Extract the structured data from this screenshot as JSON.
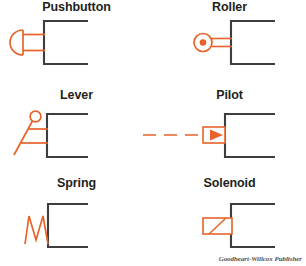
{
  "figure": {
    "credit": "Goodheart-Willcox Publisher",
    "colors": {
      "symbol_orange": "#E8632A",
      "box_dark": "#3E3E42",
      "label_text": "#231F20",
      "credit_text": "#55504E",
      "background": "#FFFFFF"
    }
  },
  "cells": [
    {
      "id": "pushbutton",
      "label": "Pushbutton",
      "icon": "pushbutton-actuator-icon",
      "description": "Semicircular button head with two-line stem attached to open-right valve box",
      "row": 1,
      "column": 1
    },
    {
      "id": "roller",
      "label": "Roller",
      "icon": "roller-actuator-icon",
      "description": "Circle with solid center dot and two-line stem attached to open-right valve box",
      "row": 1,
      "column": 2
    },
    {
      "id": "lever",
      "label": "Lever",
      "icon": "lever-actuator-icon",
      "description": "Diagonal lever arm with ball knob and two horizontal connectors to open-right valve box",
      "row": 2,
      "column": 1
    },
    {
      "id": "pilot",
      "label": "Pilot",
      "icon": "pilot-actuator-icon",
      "description": "Dashed pilot line leading to rectangle containing solid right-pointing triangle",
      "row": 2,
      "column": 2
    },
    {
      "id": "spring",
      "label": "Spring",
      "icon": "spring-actuator-icon",
      "description": "Zigzag spring coil attached to open-right valve box",
      "row": 3,
      "column": 1
    },
    {
      "id": "solenoid",
      "label": "Solenoid",
      "icon": "solenoid-actuator-icon",
      "description": "Rectangle with diagonal slash attached to open-right valve box",
      "row": 3,
      "column": 2
    }
  ]
}
